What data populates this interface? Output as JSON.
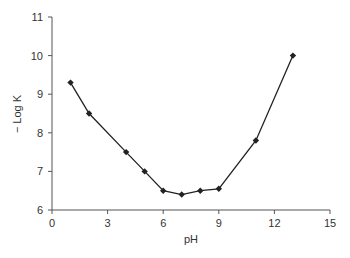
{
  "chart_data": {
    "type": "line",
    "title": "",
    "xlabel": "pH",
    "ylabel": "− Log K",
    "xlim": [
      0,
      15
    ],
    "ylim": [
      6,
      11
    ],
    "xticks": [
      0,
      3,
      6,
      9,
      12,
      15
    ],
    "yticks": [
      6,
      7,
      8,
      9,
      10,
      11
    ],
    "grid": false,
    "legend": null,
    "marker": "diamond",
    "series": [
      {
        "name": "-Log K",
        "color": "#222222",
        "x": [
          1,
          2,
          4,
          5,
          6,
          7,
          8,
          9,
          11,
          13
        ],
        "y": [
          9.3,
          8.5,
          7.5,
          7.0,
          6.5,
          6.4,
          6.5,
          6.55,
          7.8,
          10.0
        ]
      }
    ]
  },
  "colors": {
    "axis": "#555555",
    "line": "#222222",
    "text": "#333333"
  }
}
